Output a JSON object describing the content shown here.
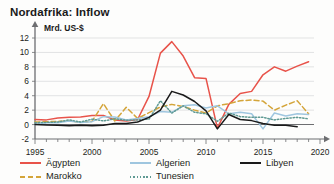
{
  "chart_data": {
    "type": "line",
    "title": "Nordafrika: Inflow",
    "ylabel": "Mrd. US-$",
    "xlabel": "",
    "xlim": [
      1995,
      2020
    ],
    "ylim": [
      -2,
      12
    ],
    "yticks": [
      -2,
      0,
      2,
      4,
      6,
      8,
      10,
      12
    ],
    "xticks": [
      1995,
      2000,
      2005,
      2010,
      2015,
      2020
    ],
    "xtick_labels": [
      "1995",
      "2000",
      "2005",
      "2010",
      "2015",
      "2020"
    ],
    "ytick_labels": [
      "-2",
      "0",
      "2",
      "4",
      "6",
      "8",
      "10",
      "12"
    ],
    "x_minor_tick_step": 1,
    "grid": "horizontal",
    "legend_position": "below",
    "x": [
      1995,
      1996,
      1997,
      1998,
      1999,
      2000,
      2001,
      2002,
      2003,
      2004,
      2005,
      2006,
      2007,
      2008,
      2009,
      2010,
      2011,
      2012,
      2013,
      2014,
      2015,
      2016,
      2017,
      2018,
      2019
    ],
    "series": [
      {
        "name": "Ägypten",
        "color": "#e8534a",
        "style": "solid",
        "values": [
          0.7,
          0.65,
          0.9,
          1.0,
          1.05,
          1.25,
          1.25,
          0.65,
          0.5,
          0.7,
          3.9,
          9.9,
          11.5,
          9.5,
          6.5,
          6.4,
          -0.5,
          2.8,
          4.3,
          4.6,
          6.9,
          8.0,
          7.4,
          8.1,
          8.7
        ]
      },
      {
        "name": "Marokko",
        "color": "#d4a53a",
        "style": "dashed",
        "values": [
          0.35,
          0.4,
          0.45,
          0.5,
          0.3,
          0.45,
          2.9,
          0.5,
          2.4,
          0.85,
          1.65,
          2.45,
          2.8,
          2.5,
          2.0,
          1.6,
          2.6,
          2.9,
          3.3,
          3.4,
          3.25,
          2.0,
          2.7,
          3.3,
          1.5
        ]
      },
      {
        "name": "Algerien",
        "color": "#9fc6df",
        "style": "solid",
        "values": [
          0.0,
          0.25,
          0.25,
          0.5,
          0.3,
          0.4,
          1.1,
          1.05,
          0.65,
          0.85,
          1.1,
          1.8,
          1.7,
          2.6,
          2.75,
          2.3,
          2.6,
          1.5,
          1.7,
          1.5,
          -0.6,
          1.6,
          1.2,
          1.5,
          1.4
        ]
      },
      {
        "name": "Tunesien",
        "color": "#5f9a93",
        "style": "dotted",
        "values": [
          0.25,
          0.3,
          0.35,
          0.65,
          0.35,
          0.75,
          0.5,
          0.8,
          0.6,
          0.65,
          0.75,
          3.3,
          1.6,
          2.6,
          1.7,
          1.5,
          0.45,
          1.6,
          1.1,
          1.0,
          1.0,
          0.65,
          0.85,
          1.0,
          0.8
        ]
      },
      {
        "name": "Libyen",
        "color": "#1a1a1a",
        "style": "solid",
        "values": [
          0.0,
          -0.05,
          -0.1,
          -0.15,
          -0.1,
          -0.15,
          -0.1,
          0.15,
          0.15,
          0.35,
          1.0,
          2.0,
          4.6,
          4.1,
          3.2,
          1.9,
          -0.6,
          1.4,
          0.7,
          0.55,
          0.15,
          -0.1,
          -0.1,
          -0.3,
          null
        ]
      }
    ]
  },
  "legend": {
    "items": [
      {
        "label": "Ägypten",
        "color": "#e8534a",
        "style": "solid"
      },
      {
        "label": "Marokko",
        "color": "#d4a53a",
        "style": "dashed"
      },
      {
        "label": "Algerien",
        "color": "#9fc6df",
        "style": "solid"
      },
      {
        "label": "Tunesien",
        "color": "#5f9a93",
        "style": "dotted"
      },
      {
        "label": "Libyen",
        "color": "#1a1a1a",
        "style": "solid"
      }
    ]
  }
}
